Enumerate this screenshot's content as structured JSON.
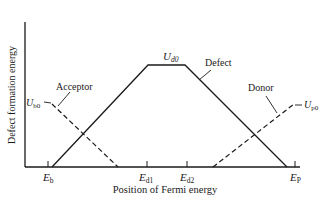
{
  "diagram": {
    "y_axis_label": "Defect formation energy",
    "x_axis_label": "Position of Fermi energy",
    "x_ticks": [
      {
        "main": "E",
        "sub": "b",
        "x": 48
      },
      {
        "main": "E",
        "sub": "d1",
        "x": 147
      },
      {
        "main": "E",
        "sub": "d2",
        "x": 187
      },
      {
        "main": "E",
        "sub": "P",
        "x": 295
      }
    ],
    "curves": {
      "defect": {
        "label": "Defect",
        "style": "solid",
        "points": [
          [
            52,
            167
          ],
          [
            148,
            65
          ],
          [
            185,
            65
          ],
          [
            287,
            167
          ]
        ]
      },
      "acceptor": {
        "label": "Acceptor",
        "style": "dashed",
        "points": [
          [
            52,
            104
          ],
          [
            118,
            167
          ]
        ]
      },
      "donor": {
        "label": "Donor",
        "style": "dashed",
        "points": [
          [
            213,
            167
          ],
          [
            294,
            104
          ]
        ]
      }
    },
    "annotations": {
      "ud0": {
        "main": "U",
        "sub": "d0"
      },
      "ub0": {
        "main": "U",
        "sub": "b0"
      },
      "up0": {
        "main": "U",
        "sub": "p0"
      }
    },
    "colors": {
      "line": "#1a1a1a",
      "background": "#ffffff"
    }
  }
}
